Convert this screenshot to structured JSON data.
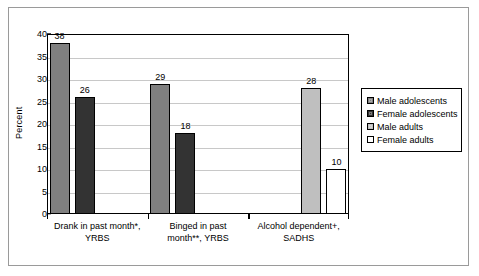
{
  "chart_data": {
    "type": "bar",
    "title": "",
    "xlabel": "",
    "ylabel": "Percent",
    "ylim": [
      0,
      40
    ],
    "yticks": [
      0,
      5,
      10,
      15,
      20,
      25,
      30,
      35,
      40
    ],
    "grid": true,
    "legend_position": "right",
    "categories": [
      "Drank in past month*, YRBS",
      "Binged in past month**, YRBS",
      "Alcohol dependent+, SADHS"
    ],
    "category_lines": [
      [
        "Drank in past month*,",
        "YRBS"
      ],
      [
        "Binged in past",
        "month**, YRBS"
      ],
      [
        "Alcohol dependent+,",
        "SADHS"
      ]
    ],
    "series": [
      {
        "name": "Male adolescents",
        "color": "#808080",
        "values": [
          38,
          29,
          null
        ]
      },
      {
        "name": "Female adolescents",
        "color": "#333333",
        "values": [
          26,
          18,
          null
        ]
      },
      {
        "name": "Male adults",
        "color": "#bfbfbf",
        "values": [
          null,
          null,
          28
        ]
      },
      {
        "name": "Female adults",
        "color": "#ffffff",
        "values": [
          null,
          null,
          10
        ]
      }
    ],
    "data_labels": [
      "38",
      "26",
      "29",
      "18",
      "28",
      "10"
    ]
  },
  "legend": {
    "items": [
      {
        "label": "Male adolescents",
        "color": "#808080"
      },
      {
        "label": "Female adolescents",
        "color": "#333333"
      },
      {
        "label": "Male adults",
        "color": "#bfbfbf"
      },
      {
        "label": "Female adults",
        "color": "#ffffff"
      }
    ]
  },
  "colors": {
    "axis": "#000000",
    "gridline": "#c8c8c8",
    "frame": "#9a9a9a",
    "background": "#ffffff"
  }
}
